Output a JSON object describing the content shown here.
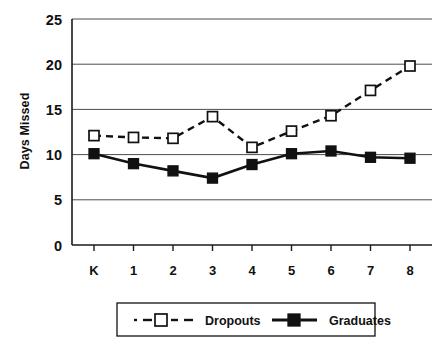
{
  "chart_data": {
    "type": "line",
    "title": "",
    "xlabel": "",
    "ylabel": "Days Missed",
    "categories": [
      "K",
      "1",
      "2",
      "3",
      "4",
      "5",
      "6",
      "7",
      "8"
    ],
    "ylim": [
      0,
      25
    ],
    "yticks": [
      0,
      5,
      10,
      15,
      20,
      25
    ],
    "ytick_labels": [
      "0",
      "5",
      "10",
      "15",
      "20",
      "25"
    ],
    "grid": true,
    "legend_position": "bottom",
    "series": [
      {
        "name": "Dropouts",
        "values": [
          12.1,
          11.9,
          11.8,
          14.2,
          10.8,
          12.6,
          14.3,
          17.1,
          19.8
        ],
        "line_style": "dashed",
        "marker": "open-square",
        "color": "#111111"
      },
      {
        "name": "Graduates",
        "values": [
          10.1,
          9.0,
          8.2,
          7.4,
          8.9,
          10.1,
          10.4,
          9.7,
          9.6
        ],
        "line_style": "solid",
        "marker": "filled-square",
        "color": "#111111"
      }
    ]
  },
  "legend": {
    "items": [
      {
        "label": "Dropouts"
      },
      {
        "label": "Graduates"
      }
    ]
  },
  "axes": {
    "y_title": "Days Missed"
  }
}
